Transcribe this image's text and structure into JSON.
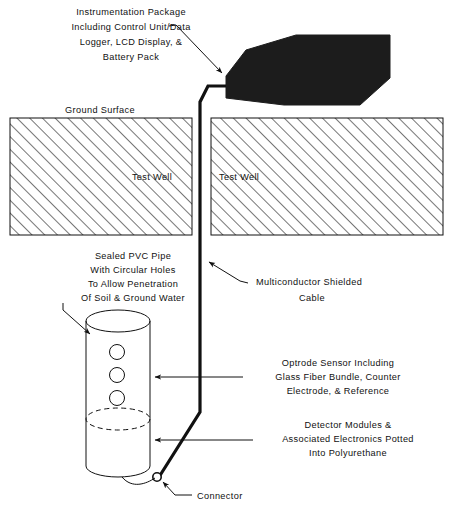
{
  "figure": {
    "title_present": false,
    "background_color": "#ffffff",
    "ink_color": "#111111",
    "instrument_box_color": "#1c1c1c"
  },
  "labels": {
    "instrumentation": {
      "name": "instrumentation-package-label",
      "lines": [
        "Instrumentation  Package",
        "Including  Control  Unit/Data",
        "Logger, LCD Display, &",
        "Battery  Pack"
      ]
    },
    "ground_surface": {
      "name": "ground-surface-label",
      "text": "Ground Surface"
    },
    "test_well_left": {
      "name": "test-well-left-label",
      "text": "Test  Well"
    },
    "test_well_right": {
      "name": "test-well-right-label",
      "text": "Test  Well"
    },
    "pvc_pipe": {
      "name": "sealed-pvc-pipe-label",
      "lines": [
        "Sealed PVC Pipe",
        "With  Circular  Holes",
        "To  Allow  Penetration",
        "Of Soil & Ground Water"
      ]
    },
    "cable": {
      "name": "multiconductor-cable-label",
      "lines": [
        "Multiconductor  Shielded",
        "Cable"
      ]
    },
    "optrode": {
      "name": "optrode-sensor-label",
      "lines": [
        "Optrode  Sensor  Including",
        "Glass Fiber Bundle, Counter",
        "Electrode,  &  Reference"
      ]
    },
    "detector": {
      "name": "detector-modules-label",
      "lines": [
        "Detector  Modules  &",
        "Associated    Electronics  Potted",
        "Into  Polyurethane"
      ]
    },
    "connector": {
      "name": "connector-label",
      "text": "Connector"
    }
  },
  "components": {
    "instrument_box": {
      "name": "instrumentation-package-box"
    },
    "ground_block_left": {
      "name": "ground-block-left"
    },
    "ground_block_right": {
      "name": "ground-block-right"
    },
    "pvc_cylinder": {
      "name": "pvc-pipe-cylinder"
    },
    "pipe_holes_count": 3,
    "dashed_water_line": {
      "name": "water-level-dashed-ellipse"
    },
    "cable_run": {
      "name": "multiconductor-cable-line"
    },
    "connector_node": {
      "name": "connector-node"
    }
  }
}
